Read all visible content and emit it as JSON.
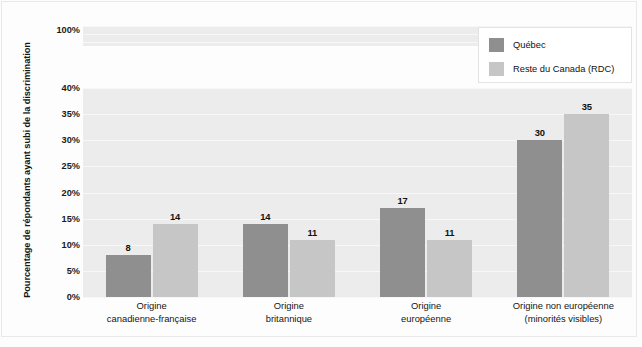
{
  "chart_data": {
    "type": "bar",
    "title": "",
    "subtitle": "",
    "xlabel": "",
    "ylabel": "Pourcentage de répondants ayant subi de la discrimination",
    "categories": [
      "Origine\ncanadienne-française",
      "Origine\nbritannique",
      "Origine\neuropéenne",
      "Origine non européenne\n(minorités visibles)"
    ],
    "category_lines": [
      [
        "Origine",
        "canadienne-française"
      ],
      [
        "Origine",
        "britannique"
      ],
      [
        "Origine",
        "européenne"
      ],
      [
        "Origine non européenne",
        "(minorités visibles)"
      ]
    ],
    "series": [
      {
        "name": "Québec",
        "color": "#8f8f8f",
        "values": [
          8,
          14,
          17,
          30
        ]
      },
      {
        "name": "Reste du Canada (RDC)",
        "color": "#c6c6c6",
        "values": [
          14,
          11,
          11,
          35
        ]
      }
    ],
    "ylim": [
      0,
      40
    ],
    "axis_break": true,
    "axis_break_note": "Échelle interrompue entre 40% et 100%",
    "ytick_labels": [
      "0%",
      "5%",
      "10%",
      "15%",
      "20%",
      "25%",
      "30%",
      "35%",
      "40%",
      "100%"
    ],
    "ytick_values": [
      0,
      5,
      10,
      15,
      20,
      25,
      30,
      35,
      40,
      100
    ],
    "grid": true,
    "legend_position": "top-right",
    "value_labels": true
  },
  "legend": {
    "items": [
      {
        "label": "Québec",
        "color": "#8f8f8f"
      },
      {
        "label": "Reste du Canada (RDC)",
        "color": "#c6c6c6"
      }
    ]
  },
  "axis": {
    "y_title": "Pourcentage de répondants ayant subi de la discrimination",
    "ticks": [
      {
        "label": "100%",
        "value": 100
      },
      {
        "label": "40%",
        "value": 40
      },
      {
        "label": "35%",
        "value": 35
      },
      {
        "label": "30%",
        "value": 30
      },
      {
        "label": "25%",
        "value": 25
      },
      {
        "label": "20%",
        "value": 20
      },
      {
        "label": "15%",
        "value": 15
      },
      {
        "label": "10%",
        "value": 10
      },
      {
        "label": "5%",
        "value": 5
      },
      {
        "label": "0%",
        "value": 0
      }
    ]
  },
  "colors": {
    "quebec": "#8f8f8f",
    "rdc": "#c6c6c6",
    "plot_background": "#ececec",
    "figure_background": "#fdfdfd",
    "gridline": "#f7f7f7"
  }
}
